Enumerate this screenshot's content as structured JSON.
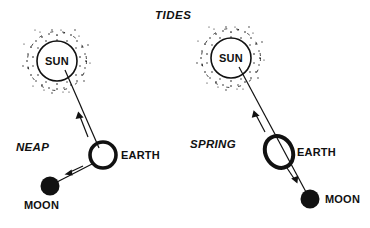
{
  "figure": {
    "title": "TIDES",
    "background_color": "#ffffff",
    "ink_color": "#111111",
    "panels": [
      {
        "id": "neap",
        "label": "NEAP",
        "bodies": {
          "sun": {
            "name": "SUN",
            "label": "SUN",
            "cx": 57,
            "cy": 61,
            "r": 20,
            "corona": "dotted-ring",
            "style": "open-circle"
          },
          "earth": {
            "name": "EARTH",
            "label": "EARTH",
            "cx": 103,
            "cy": 155,
            "rx": 14,
            "ry": 14,
            "rotation": 0,
            "style": "thick-ring",
            "label_x": 122,
            "label_y": 159
          },
          "moon": {
            "name": "MOON",
            "label": "MOON",
            "cx": 50,
            "cy": 186,
            "r": 9.5,
            "style": "filled-disc",
            "label_x": 24,
            "label_y": 209
          }
        },
        "lines": [
          {
            "name": "sun-earth-line",
            "x1": 65,
            "y1": 70,
            "x2": 97,
            "y2": 146
          },
          {
            "name": "earth-moon-line",
            "x1": 92,
            "y1": 166,
            "x2": 58,
            "y2": 182
          }
        ],
        "arrows": [
          {
            "name": "arrow-to-sun",
            "direction": "toward-sun"
          },
          {
            "name": "arrow-to-moon",
            "direction": "toward-moon"
          }
        ],
        "label_x": 16,
        "label_y": 151
      },
      {
        "id": "spring",
        "label": "SPRING",
        "bodies": {
          "sun": {
            "name": "SUN",
            "label": "SUN",
            "cx": 231,
            "cy": 58,
            "r": 20,
            "corona": "dotted-ring",
            "style": "open-circle"
          },
          "earth": {
            "name": "EARTH",
            "label": "EARTH",
            "cx": 279,
            "cy": 152,
            "rx": 17,
            "ry": 14,
            "rotation": -62,
            "style": "thick-ring",
            "label_x": 297,
            "label_y": 156
          },
          "moon": {
            "name": "MOON",
            "label": "MOON",
            "cx": 310,
            "cy": 199,
            "r": 9.5,
            "style": "filled-disc",
            "label_x": 325,
            "label_y": 203
          }
        },
        "lines": [
          {
            "name": "sun-earth-line",
            "x1": 239,
            "y1": 67,
            "x2": 274,
            "y2": 143
          },
          {
            "name": "earth-moon-line",
            "x1": 285,
            "y1": 163,
            "x2": 305,
            "y2": 190
          }
        ],
        "arrows": [
          {
            "name": "arrow-to-sun",
            "direction": "toward-sun"
          },
          {
            "name": "arrow-to-moon",
            "direction": "toward-moon"
          }
        ],
        "label_x": 190,
        "label_y": 148
      }
    ]
  }
}
